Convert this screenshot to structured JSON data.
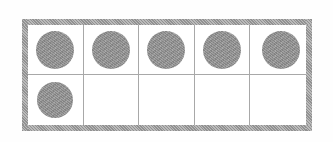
{
  "figure": {
    "name": "ten-frame",
    "rows": 2,
    "columns": 5,
    "total_cells": 10,
    "filled_count": 6,
    "empty_count": 4,
    "background_color": "#ffffff",
    "frame_border_color": "#9c9c9c",
    "grid_line_color": "#a8a8a8",
    "counter_color": "#8c8c8c",
    "frame_border_width_px": 6
  },
  "chart_data": {
    "type": "table",
    "title": "",
    "xlabel": "",
    "ylabel": "",
    "categories": [
      "col-1",
      "col-2",
      "col-3",
      "col-4",
      "col-5"
    ],
    "series": [
      {
        "name": "row-1",
        "values": [
          1,
          1,
          1,
          1,
          1
        ]
      },
      {
        "name": "row-2",
        "values": [
          1,
          0,
          0,
          0,
          0
        ]
      }
    ],
    "filled_total": 6,
    "capacity": 10
  },
  "cells": [
    {
      "id": "cell-r1c1",
      "row": 1,
      "column": 1,
      "filled": true,
      "counter_label": "counter"
    },
    {
      "id": "cell-r1c2",
      "row": 1,
      "column": 2,
      "filled": true,
      "counter_label": "counter"
    },
    {
      "id": "cell-r1c3",
      "row": 1,
      "column": 3,
      "filled": true,
      "counter_label": "counter"
    },
    {
      "id": "cell-r1c4",
      "row": 1,
      "column": 4,
      "filled": true,
      "counter_label": "counter"
    },
    {
      "id": "cell-r1c5",
      "row": 1,
      "column": 5,
      "filled": true,
      "counter_label": "counter"
    },
    {
      "id": "cell-r2c1",
      "row": 2,
      "column": 1,
      "filled": true,
      "counter_label": "counter"
    },
    {
      "id": "cell-r2c2",
      "row": 2,
      "column": 2,
      "filled": false,
      "counter_label": ""
    },
    {
      "id": "cell-r2c3",
      "row": 2,
      "column": 3,
      "filled": false,
      "counter_label": ""
    },
    {
      "id": "cell-r2c4",
      "row": 2,
      "column": 4,
      "filled": false,
      "counter_label": ""
    },
    {
      "id": "cell-r2c5",
      "row": 2,
      "column": 5,
      "filled": false,
      "counter_label": ""
    }
  ]
}
